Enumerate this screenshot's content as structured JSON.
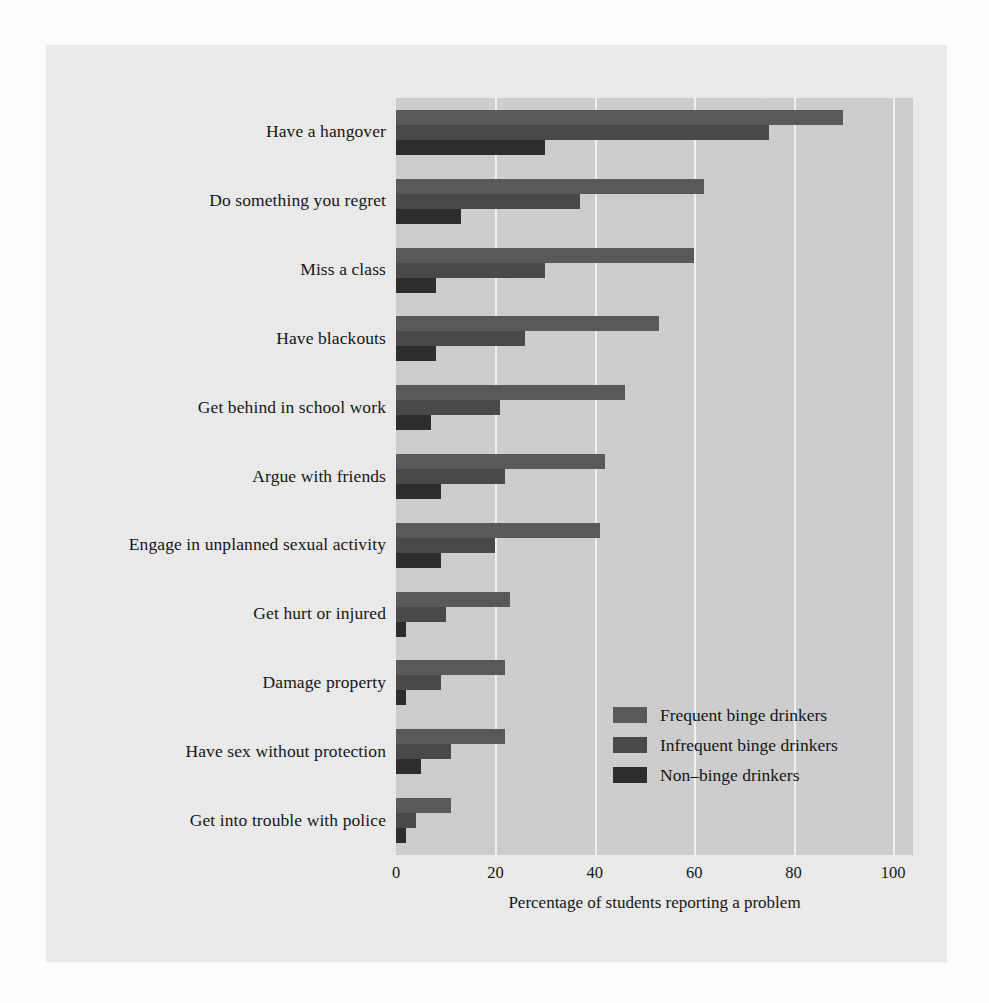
{
  "chart_data": {
    "type": "bar",
    "orientation": "horizontal",
    "title": "",
    "xlabel": "Percentage of students reporting a problem",
    "ylabel": "",
    "xlim": [
      0,
      100
    ],
    "xticks": [
      0,
      20,
      40,
      60,
      80,
      100
    ],
    "xtick_labels": [
      "0",
      "20",
      "40",
      "60",
      "80",
      "100"
    ],
    "grid": true,
    "grid_axis": "x",
    "legend_position": "lower right inside plot",
    "categories": [
      "Have a hangover",
      "Do something you regret",
      "Miss a class",
      "Have blackouts",
      "Get behind in school work",
      "Argue with friends",
      "Engage in unplanned sexual activity",
      "Get hurt or injured",
      "Damage property",
      "Have sex without protection",
      "Get into trouble with police"
    ],
    "series": [
      {
        "name": "Frequent binge drinkers",
        "color": "#5a5a5a",
        "values": [
          90,
          62,
          60,
          53,
          46,
          42,
          41,
          23,
          22,
          22,
          11
        ]
      },
      {
        "name": "Infrequent binge drinkers",
        "color": "#4a4a4a",
        "values": [
          75,
          37,
          30,
          26,
          21,
          22,
          20,
          10,
          9,
          11,
          4
        ]
      },
      {
        "name": "Non–binge drinkers",
        "color": "#2e2e2e",
        "values": [
          30,
          13,
          8,
          8,
          7,
          9,
          9,
          2,
          2,
          5,
          2
        ]
      }
    ]
  },
  "colors": {
    "panel_background": "#cfcfcf",
    "page_background": "#ececec",
    "gridline": "#f3f3f3",
    "text": "#161616",
    "frequent": "#5a5a5a",
    "infrequent": "#4a4a4a",
    "nonbinge": "#2e2e2e"
  }
}
